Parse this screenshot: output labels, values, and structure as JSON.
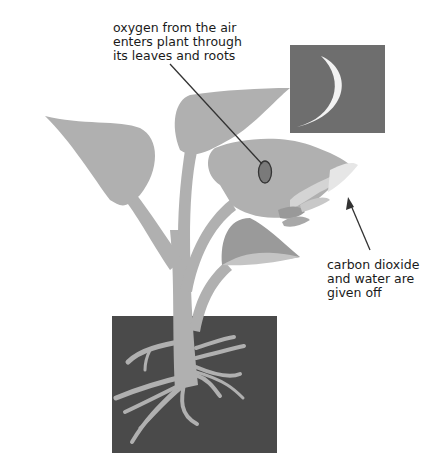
{
  "diagram": {
    "labels": {
      "oxygen": "oxygen from the air\nenters plant through\nits leaves and roots",
      "carbon_dioxide": "carbon dioxide\nand water are\ngiven off"
    },
    "elements": {
      "night_sky": "night sky with crescent moon",
      "plant": "plant with leaves and stem",
      "stoma": "stoma on leaf",
      "gas_out": "carbon dioxide and water vapour leaving leaf",
      "soil": "soil with roots"
    },
    "colors": {
      "sky": "#6e6e6e",
      "moon": "#f2f2f2",
      "plant": "#b0b0b0",
      "leaf_dark": "#9a9a9a",
      "soil": "#4a4a4a",
      "stoma": "#7a7a7a",
      "text": "#1a1a1a"
    }
  }
}
